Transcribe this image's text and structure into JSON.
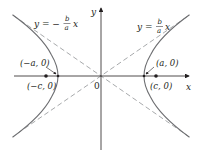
{
  "diagram": {
    "colors": {
      "axis": "#231f20",
      "curve": "#6d6e71",
      "asymptote": "#9d9fa2",
      "point": "#231f20",
      "text": "#231f20"
    },
    "axes": {
      "x_label": "x",
      "y_label": "y",
      "origin_label": "0"
    },
    "asymptotes": [
      {
        "label_lhs": "y = ",
        "sign": "",
        "num": "b",
        "den": "a",
        "var": "x",
        "side": "right"
      },
      {
        "label_lhs": "y = ",
        "sign": "−",
        "num": "b",
        "den": "a",
        "var": "x",
        "side": "left"
      }
    ],
    "points": [
      {
        "label": "(a, 0)",
        "name": "vertex-right"
      },
      {
        "label": "(−a, 0)",
        "name": "vertex-left"
      },
      {
        "label": "(c, 0)",
        "name": "focus-right"
      },
      {
        "label": "(−c, 0)",
        "name": "focus-left"
      }
    ]
  }
}
